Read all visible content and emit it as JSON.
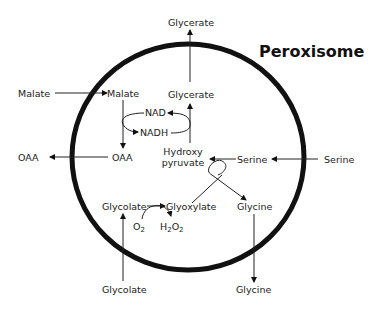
{
  "diagram": {
    "title": "Peroxisome",
    "compartment": "peroxisome",
    "labels": {
      "glycerate_out": "Glycerate",
      "glycerate_in": "Glycerate",
      "malate_out": "Malate",
      "malate_in": "Malate",
      "nad": "NAD",
      "nadh": "NADH",
      "oaa_out": "OAA",
      "oaa_in": "OAA",
      "hydroxy": "Hydroxy",
      "pyruvate": "pyruvate",
      "serine_in": "Serine",
      "serine_out": "Serine",
      "glycolate_in": "Glycolate",
      "glyoxylate": "Glyoxylate",
      "glycine_in": "Glycine",
      "glycine_out": "Glycine",
      "o2": "O",
      "o2_sub": "2",
      "h2o2_h": "H",
      "h2o2_sub1": "2",
      "h2o2_o": "O",
      "h2o2_sub2": "2",
      "glycolate_out": "Glycolate"
    },
    "flows": [
      {
        "from": "Malate (outside)",
        "to": "Malate (inside)"
      },
      {
        "from": "Malate",
        "to": "OAA",
        "cofactor": "NAD → NADH"
      },
      {
        "from": "OAA (inside)",
        "to": "OAA (outside)"
      },
      {
        "from": "Hydroxypyruvate",
        "to": "Glycerate",
        "cofactor": "NADH → NAD"
      },
      {
        "from": "Glycerate (inside)",
        "to": "Glycerate (outside)"
      },
      {
        "from": "Serine (outside)",
        "to": "Serine (inside)"
      },
      {
        "from": "Serine + Glyoxylate",
        "to": "Hydroxypyruvate + Glycine"
      },
      {
        "from": "Glycolate (outside)",
        "to": "Glycolate (inside)"
      },
      {
        "from": "Glycolate",
        "to": "Glyoxylate",
        "cofactor": "O2 → H2O2"
      },
      {
        "from": "Glycine (inside)",
        "to": "Glycine (outside)"
      }
    ]
  }
}
